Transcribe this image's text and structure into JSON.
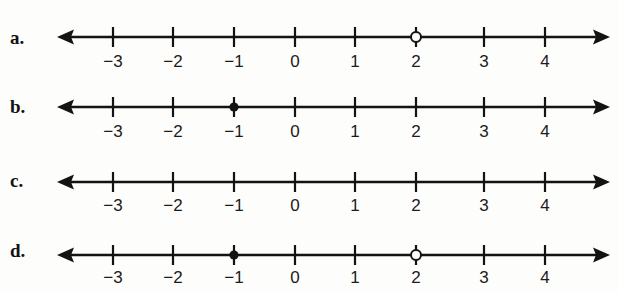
{
  "page": {
    "kind": "number-line-worksheet",
    "background_color": "#fdfdfc",
    "ink_color": "#131313",
    "width": 619,
    "height": 293
  },
  "axis": {
    "tick_labels": [
      "−3",
      "−2",
      "−1",
      "0",
      "1",
      "2",
      "3",
      "4"
    ],
    "tick_values": [
      -3,
      -2,
      -1,
      0,
      1,
      2,
      3,
      4
    ],
    "tick_x": [
      113,
      173,
      234,
      295,
      355,
      416,
      484,
      545
    ],
    "left_arrow_x": 57,
    "right_arrow_x": 610,
    "left_end_label": "arrow-left",
    "right_end_label": "arrow-right"
  },
  "lines": [
    {
      "label": "a.",
      "baseline_y": 37,
      "label_y": 27,
      "tick_label_y": 52,
      "points": [
        {
          "value": 2,
          "x": 416,
          "style": "open",
          "name": "open-circle-at-2"
        }
      ]
    },
    {
      "label": "b.",
      "baseline_y": 107,
      "label_y": 96,
      "tick_label_y": 122,
      "points": [
        {
          "value": -1,
          "x": 234,
          "style": "closed",
          "name": "closed-dot-at-minus-1"
        }
      ]
    },
    {
      "label": "c.",
      "baseline_y": 182,
      "label_y": 170,
      "tick_label_y": 196,
      "points": []
    },
    {
      "label": "d.",
      "baseline_y": 255,
      "label_y": 240,
      "tick_label_y": 268,
      "points": [
        {
          "value": -1,
          "x": 234,
          "style": "closed",
          "name": "closed-dot-at-minus-1"
        },
        {
          "value": 2,
          "x": 416,
          "style": "open",
          "name": "open-circle-at-2"
        }
      ]
    }
  ]
}
